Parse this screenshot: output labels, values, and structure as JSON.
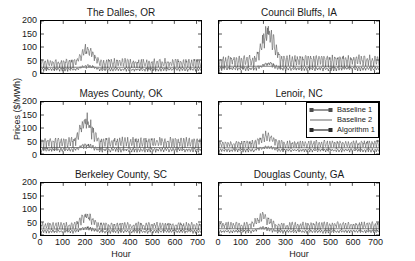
{
  "figure": {
    "ylabel": "Prices ($/MWh)",
    "xlabel": "Hour"
  },
  "legend": {
    "position": "middle-right-panel-top-right",
    "entries": [
      {
        "label": "Baseline 1",
        "style": "line-marker",
        "color": "#4d4d4d",
        "marker": "square"
      },
      {
        "label": "Baseline 2",
        "style": "line",
        "color": "#808080",
        "marker": "none"
      },
      {
        "label": "Algorithm 1",
        "style": "line-marker",
        "color": "#2b2b2b",
        "marker": "square"
      }
    ]
  },
  "chart_data": {
    "type": "line",
    "title": "",
    "xlabel": "Hour",
    "ylabel": "Prices ($/MWh)",
    "xlim": [
      0,
      720
    ],
    "ylim": [
      0,
      200
    ],
    "xticks": [
      0,
      100,
      200,
      300,
      400,
      500,
      600,
      700
    ],
    "yticks": [
      0,
      50,
      100,
      150,
      200
    ],
    "grid": false,
    "legend_entries": [
      "Baseline 1",
      "Baseline 2",
      "Algorithm 1"
    ],
    "layout": {
      "rows": 3,
      "cols": 2
    },
    "panels": [
      {
        "title": "The Dalles, OR",
        "row": 0,
        "col": 0,
        "series": [
          {
            "name": "Baseline 1",
            "mean": 34,
            "amplitude": 16,
            "peak": 100,
            "peak_hour": 210,
            "color": "#4d4d4d"
          },
          {
            "name": "Baseline 2",
            "mean": 22,
            "amplitude": 1,
            "peak": 23,
            "peak_hour": 0,
            "color": "#808080"
          },
          {
            "name": "Algorithm 1",
            "mean": 13,
            "amplitude": 5,
            "peak": 30,
            "peak_hour": 210,
            "color": "#2b2b2b"
          }
        ]
      },
      {
        "title": "Council Bluffs, IA",
        "row": 0,
        "col": 1,
        "series": [
          {
            "name": "Baseline 1",
            "mean": 42,
            "amplitude": 20,
            "peak": 180,
            "peak_hour": 220,
            "color": "#4d4d4d"
          },
          {
            "name": "Baseline 2",
            "mean": 26,
            "amplitude": 1,
            "peak": 27,
            "peak_hour": 0,
            "color": "#808080"
          },
          {
            "name": "Algorithm 1",
            "mean": 16,
            "amplitude": 6,
            "peak": 40,
            "peak_hour": 220,
            "color": "#2b2b2b"
          }
        ]
      },
      {
        "title": "Mayes County, OK",
        "row": 1,
        "col": 0,
        "series": [
          {
            "name": "Baseline 1",
            "mean": 40,
            "amplitude": 18,
            "peak": 148,
            "peak_hour": 205,
            "color": "#4d4d4d"
          },
          {
            "name": "Baseline 2",
            "mean": 25,
            "amplitude": 1,
            "peak": 26,
            "peak_hour": 0,
            "color": "#808080"
          },
          {
            "name": "Algorithm 1",
            "mean": 15,
            "amplitude": 6,
            "peak": 38,
            "peak_hour": 205,
            "color": "#2b2b2b"
          }
        ]
      },
      {
        "title": "Lenoir, NC",
        "row": 1,
        "col": 1,
        "series": [
          {
            "name": "Baseline 1",
            "mean": 34,
            "amplitude": 14,
            "peak": 72,
            "peak_hour": 215,
            "color": "#4d4d4d"
          },
          {
            "name": "Baseline 2",
            "mean": 24,
            "amplitude": 1,
            "peak": 25,
            "peak_hour": 0,
            "color": "#808080"
          },
          {
            "name": "Algorithm 1",
            "mean": 14,
            "amplitude": 5,
            "peak": 30,
            "peak_hour": 215,
            "color": "#2b2b2b"
          }
        ]
      },
      {
        "title": "Berkeley County, SC",
        "row": 2,
        "col": 0,
        "series": [
          {
            "name": "Baseline 1",
            "mean": 32,
            "amplitude": 13,
            "peak": 78,
            "peak_hour": 205,
            "color": "#4d4d4d"
          },
          {
            "name": "Baseline 2",
            "mean": 23,
            "amplitude": 1,
            "peak": 24,
            "peak_hour": 0,
            "color": "#808080"
          },
          {
            "name": "Algorithm 1",
            "mean": 13,
            "amplitude": 5,
            "peak": 30,
            "peak_hour": 205,
            "color": "#2b2b2b"
          }
        ]
      },
      {
        "title": "Douglas County, GA",
        "row": 2,
        "col": 1,
        "series": [
          {
            "name": "Baseline 1",
            "mean": 33,
            "amplitude": 13,
            "peak": 76,
            "peak_hour": 200,
            "color": "#4d4d4d"
          },
          {
            "name": "Baseline 2",
            "mean": 24,
            "amplitude": 1,
            "peak": 25,
            "peak_hour": 0,
            "color": "#808080"
          },
          {
            "name": "Algorithm 1",
            "mean": 13,
            "amplitude": 5,
            "peak": 30,
            "peak_hour": 200,
            "color": "#2b2b2b"
          }
        ]
      }
    ]
  }
}
